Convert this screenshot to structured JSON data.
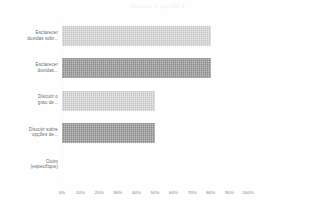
{
  "chart_data": {
    "type": "bar",
    "orientation": "horizontal",
    "title": "Assinale a questão 3",
    "xlabel": "",
    "ylabel": "",
    "xlim": [
      0,
      100
    ],
    "grid": false,
    "legend": null,
    "categories": [
      "Esclarecer\nduvidas sobr...",
      "Esclarecer\nduvidas...",
      "Discutir o\ngrau de...",
      "Discutir sobre\nopções de...",
      "Outro\n(especifique)"
    ],
    "category_lines": [
      [
        "Esclarecer",
        "duvidas sobr..."
      ],
      [
        "Esclarecer",
        "duvidas..."
      ],
      [
        "Discutir o",
        "grau de..."
      ],
      [
        "Discutir sobre",
        "opções de..."
      ],
      [
        "Outro",
        "(especifique)"
      ]
    ],
    "values": [
      80,
      80,
      50,
      50,
      0
    ],
    "bar_colors": [
      "#d9d9d9",
      "#9a9a9a",
      "#d9d9d9",
      "#9a9a9a",
      "#d9d9d9"
    ],
    "tick_values": [
      0,
      10,
      20,
      30,
      40,
      50,
      60,
      70,
      80,
      90,
      100
    ],
    "tick_labels": [
      "0%",
      "10%",
      "20%",
      "30%",
      "40%",
      "50%",
      "60%",
      "70%",
      "80%",
      "90%",
      "100%"
    ]
  },
  "colors": {
    "background": "#fefefe",
    "bar_light": "#d9d9d9",
    "bar_dark": "#9a9a9a",
    "label_text": "#6b6b6b",
    "tick_text": "#7a7a7a",
    "title_text": "#f0f0f0"
  }
}
